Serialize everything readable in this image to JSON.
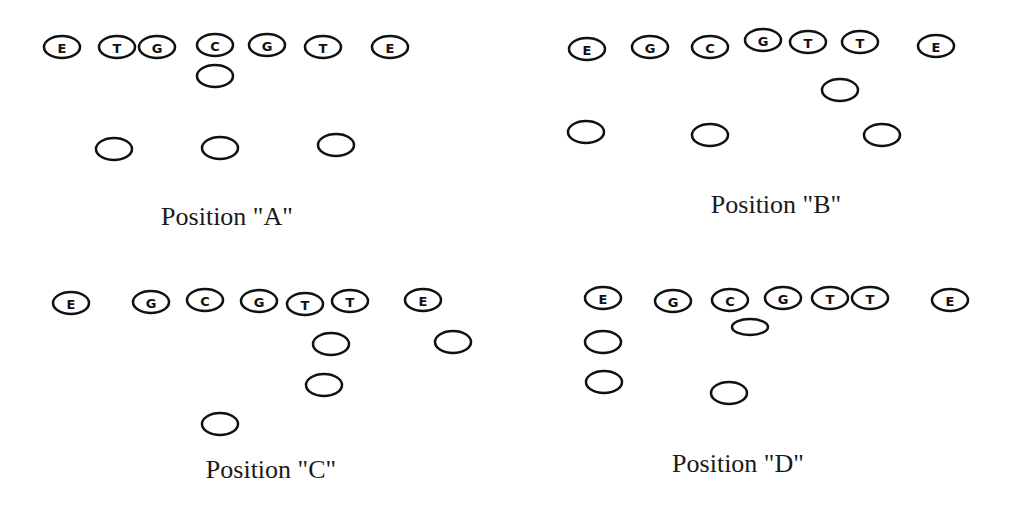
{
  "diagram": {
    "stroke_color": "#111111",
    "background": "#ffffff",
    "positions": [
      {
        "id": "A",
        "caption": "Position \"A\"",
        "caption_pos": [
          227,
          202
        ],
        "line": [
          {
            "label": "E",
            "x": 62,
            "y": 47
          },
          {
            "label": "T",
            "x": 117,
            "y": 47
          },
          {
            "label": "G",
            "x": 157,
            "y": 47
          },
          {
            "label": "C",
            "x": 215,
            "y": 45
          },
          {
            "label": "G",
            "x": 267,
            "y": 45
          },
          {
            "label": "T",
            "x": 323,
            "y": 47
          },
          {
            "label": "E",
            "x": 390,
            "y": 47
          }
        ],
        "backs": [
          {
            "x": 215,
            "y": 76
          },
          {
            "x": 114,
            "y": 149
          },
          {
            "x": 220,
            "y": 148
          },
          {
            "x": 336,
            "y": 145
          }
        ]
      },
      {
        "id": "B",
        "caption": "Position \"B\"",
        "caption_pos": [
          776,
          190
        ],
        "line": [
          {
            "label": "E",
            "x": 587,
            "y": 49
          },
          {
            "label": "G",
            "x": 650,
            "y": 47
          },
          {
            "label": "C",
            "x": 710,
            "y": 47
          },
          {
            "label": "G",
            "x": 763,
            "y": 40
          },
          {
            "label": "T",
            "x": 808,
            "y": 42
          },
          {
            "label": "T",
            "x": 860,
            "y": 42
          },
          {
            "label": "E",
            "x": 936,
            "y": 46
          }
        ],
        "backs": [
          {
            "x": 840,
            "y": 90
          },
          {
            "x": 586,
            "y": 132
          },
          {
            "x": 710,
            "y": 135
          },
          {
            "x": 882,
            "y": 135
          }
        ]
      },
      {
        "id": "C",
        "caption": "Position \"C\"",
        "caption_pos": [
          271,
          455
        ],
        "line": [
          {
            "label": "E",
            "x": 71,
            "y": 303
          },
          {
            "label": "G",
            "x": 151,
            "y": 302
          },
          {
            "label": "C",
            "x": 205,
            "y": 300
          },
          {
            "label": "G",
            "x": 259,
            "y": 301
          },
          {
            "label": "T",
            "x": 305,
            "y": 304
          },
          {
            "label": "T",
            "x": 350,
            "y": 301
          },
          {
            "label": "E",
            "x": 423,
            "y": 300
          }
        ],
        "backs": [
          {
            "x": 331,
            "y": 344
          },
          {
            "x": 453,
            "y": 342
          },
          {
            "label": "",
            "x": 324,
            "y": 385
          },
          {
            "x": 220,
            "y": 424
          }
        ]
      },
      {
        "id": "D",
        "caption": "Position \"D\"",
        "caption_pos": [
          738,
          449
        ],
        "line": [
          {
            "label": "E",
            "x": 603,
            "y": 298
          },
          {
            "label": "G",
            "x": 673,
            "y": 301
          },
          {
            "label": "C",
            "x": 730,
            "y": 300
          },
          {
            "label": "G",
            "x": 783,
            "y": 298
          },
          {
            "label": "T",
            "x": 830,
            "y": 298
          },
          {
            "label": "T",
            "x": 870,
            "y": 298
          },
          {
            "label": "E",
            "x": 950,
            "y": 300
          }
        ],
        "backs": [
          {
            "x": 750,
            "y": 327,
            "rx": 18,
            "ry": 8
          },
          {
            "x": 603,
            "y": 342
          },
          {
            "x": 604,
            "y": 382
          },
          {
            "x": 729,
            "y": 393
          }
        ]
      }
    ]
  }
}
